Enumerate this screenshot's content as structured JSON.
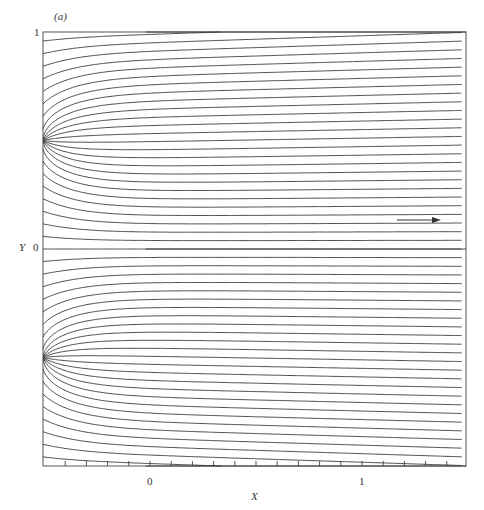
{
  "figure": {
    "panel_label": "(a)",
    "xlabel": "X",
    "ylabel": "Y",
    "x_tick_labels": [
      "0",
      "1"
    ],
    "y_tick_labels": [
      "1",
      "0"
    ],
    "flow_direction": "right",
    "line_color": "#3a3a3a"
  },
  "chart_data": {
    "type": "streamline",
    "title": "(a)",
    "xlabel": "X",
    "ylabel": "Y",
    "xlim": [
      -0.505,
      1.47
    ],
    "ylim": [
      -1,
      1
    ],
    "x_ticks_labeled": [
      0,
      1
    ],
    "y_ticks_labeled": [
      0,
      1
    ],
    "x_minor_tick_spacing": 0.1,
    "grid": false,
    "legend": null,
    "annotations": [
      {
        "type": "arrow",
        "x_from": 1.16,
        "x_to": 1.36,
        "y": 0.13,
        "meaning": "uniform stream direction"
      }
    ],
    "features": {
      "sources_on_left_wall_Y": [
        0.5,
        -0.5
      ],
      "saddle_points": [
        {
          "X": -0.02,
          "Y": 0.0
        },
        {
          "X": -0.02,
          "Y": 1.0
        },
        {
          "X": -0.02,
          "Y": -1.0
        }
      ],
      "recirculation_centers_Y": [
        0.75,
        0.25,
        -0.25,
        -0.75
      ],
      "far_field": "uniform horizontal flow toward +X"
    }
  }
}
